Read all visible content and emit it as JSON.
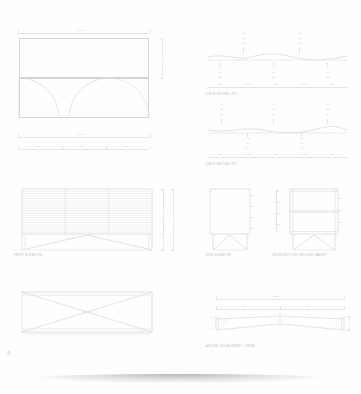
{
  "sheet": {
    "page_number": "5",
    "background_color": "#fefefe",
    "line_color": "#d2d5d9"
  },
  "views": [
    {
      "id": "plan-view-top",
      "caption": "",
      "dimensions_top": [
        "1800"
      ],
      "dimensions_bottom": [
        "1800"
      ],
      "dimensions_bottom_split": [
        "600",
        "600",
        "600"
      ],
      "dimension_right": [
        "450"
      ]
    },
    {
      "id": "curve-profile-1",
      "caption": "CURVE SETTING OUT",
      "upper_stacks": [
        {
          "values": [
            "45",
            "30",
            "15"
          ]
        },
        {
          "values": [
            "45",
            "30",
            "15"
          ]
        }
      ],
      "lower_stacks": [
        {
          "values": [
            "45",
            "30",
            "15"
          ]
        },
        {
          "values": [
            "45",
            "30",
            "15"
          ]
        },
        {
          "values": [
            "45",
            "30",
            "15"
          ]
        }
      ],
      "baseline_dims": [
        "300",
        "300",
        "300",
        "300",
        "300"
      ]
    },
    {
      "id": "curve-profile-2",
      "caption": "CURVE SETTING OUT",
      "upper_stacks": [
        {
          "values": [
            "45",
            "30",
            "15"
          ]
        },
        {
          "values": [
            "45",
            "30",
            "15"
          ]
        },
        {
          "values": [
            "45",
            "30",
            "15"
          ]
        }
      ],
      "lower_stacks": [
        {
          "values": [
            "45",
            "30",
            "15"
          ]
        },
        {
          "values": [
            "45",
            "30",
            "15"
          ]
        }
      ],
      "baseline_dims": [
        "300",
        "300",
        "300",
        "300",
        "300"
      ]
    },
    {
      "id": "front-elevation",
      "caption": "FRONT ELEVATION",
      "slat_count": 18,
      "bay_count": 3,
      "dimension_right_upper": [
        "600"
      ],
      "dimension_right_lower": [
        "150"
      ],
      "dimension_right_overall": [
        "750"
      ]
    },
    {
      "id": "side-elevation",
      "caption": "SIDE ELEVATION"
    },
    {
      "id": "cross-section",
      "caption": "CROSS SECTION THROUGH CABINET",
      "shelf_count": 2,
      "dimension_left_stack": [
        "150",
        "150",
        "150",
        "150"
      ]
    },
    {
      "id": "plan-view-bottom",
      "caption": ""
    },
    {
      "id": "leg-frame-detail",
      "caption": "ANGLED LEG ASSEMBLY - DETAIL",
      "dimension_top_overall": [
        "1800"
      ],
      "dimension_top_split": [
        "900",
        "900"
      ],
      "dimension_right": [
        "150"
      ]
    }
  ]
}
